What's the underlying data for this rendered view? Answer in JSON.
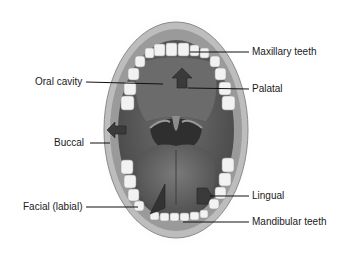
{
  "figure": {
    "labels": [
      {
        "id": "maxillary-teeth",
        "text": "Maxillary teeth",
        "side": "right"
      },
      {
        "id": "oral-cavity",
        "text": "Oral cavity",
        "side": "left"
      },
      {
        "id": "palatal",
        "text": "Palatal",
        "side": "right"
      },
      {
        "id": "buccal",
        "text": "Buccal",
        "side": "left"
      },
      {
        "id": "facial-labial",
        "text": "Facial (labial)",
        "side": "left"
      },
      {
        "id": "lingual",
        "text": "Lingual",
        "side": "right"
      },
      {
        "id": "mandibular-teeth",
        "text": "Mandibular teeth",
        "side": "right"
      }
    ],
    "arrows": [
      {
        "id": "palatal-arrow",
        "direction": "up"
      },
      {
        "id": "buccal-arrow",
        "direction": "left"
      },
      {
        "id": "facial-arrow",
        "direction": "down-left"
      },
      {
        "id": "lingual-arrow",
        "direction": "right"
      }
    ]
  },
  "colors": {
    "background": "#ffffff",
    "lip": "#c9c9c9",
    "cavity": "#5e5e5e",
    "tongue": "#6a6a6a",
    "teeth": "#f2f2f2",
    "arrow": "#3a3a3a",
    "leader_line": "#111111",
    "text": "#1a1a1a"
  }
}
